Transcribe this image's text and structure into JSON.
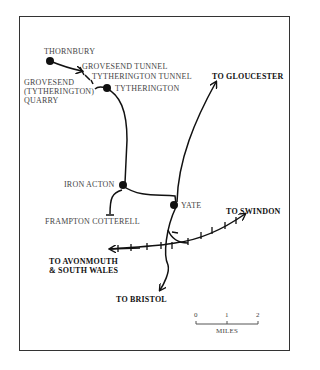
{
  "map": {
    "stations": [
      {
        "name": "THORNBURY"
      },
      {
        "name": "TYTHERINGTON"
      },
      {
        "name": "IRON ACTON"
      },
      {
        "name": "YATE"
      }
    ],
    "tunnels": [
      {
        "name": "GROVESEND TUNNEL"
      },
      {
        "name": "TYTHERINGTON TUNNEL"
      }
    ],
    "sidings": [
      {
        "name": "GROVESEND\n(TYTHERINGTON)\nQUARRY"
      },
      {
        "name": "FRAMPTON COTTERELL"
      }
    ],
    "destinations": [
      {
        "name": "TO GLOUCESTER"
      },
      {
        "name": "TO SWINDON"
      },
      {
        "name": "TO AVONMOUTH\n& SOUTH WALES"
      },
      {
        "name": "TO BRISTOL"
      }
    ],
    "scale": {
      "ticks": [
        "0",
        "1",
        "2"
      ],
      "unit": "MILES"
    }
  }
}
